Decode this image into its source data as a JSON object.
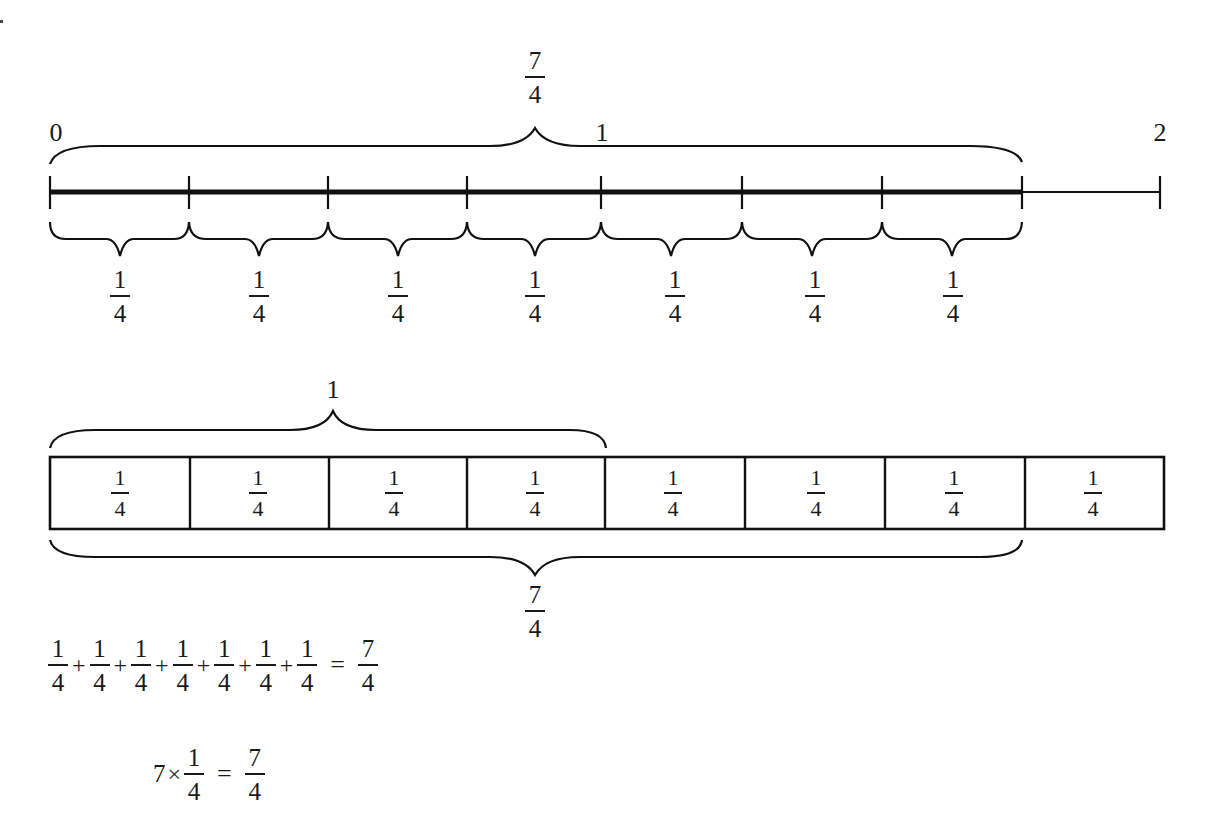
{
  "number_line": {
    "start_label": "0",
    "mid_label": "1",
    "end_label": "2",
    "total_brace_label": {
      "numerator": "7",
      "denominator": "4"
    },
    "segment_labels": [
      {
        "numerator": "1",
        "denominator": "4"
      },
      {
        "numerator": "1",
        "denominator": "4"
      },
      {
        "numerator": "1",
        "denominator": "4"
      },
      {
        "numerator": "1",
        "denominator": "4"
      },
      {
        "numerator": "1",
        "denominator": "4"
      },
      {
        "numerator": "1",
        "denominator": "4"
      },
      {
        "numerator": "1",
        "denominator": "4"
      }
    ],
    "range": [
      0,
      2
    ],
    "tick_step": "1/4",
    "highlighted_up_to": "7/4"
  },
  "tape_diagram": {
    "top_brace_label": "1",
    "bottom_brace_label": {
      "numerator": "7",
      "denominator": "4"
    },
    "cells": [
      {
        "numerator": "1",
        "denominator": "4"
      },
      {
        "numerator": "1",
        "denominator": "4"
      },
      {
        "numerator": "1",
        "denominator": "4"
      },
      {
        "numerator": "1",
        "denominator": "4"
      },
      {
        "numerator": "1",
        "denominator": "4"
      },
      {
        "numerator": "1",
        "denominator": "4"
      },
      {
        "numerator": "1",
        "denominator": "4"
      },
      {
        "numerator": "1",
        "denominator": "4"
      }
    ]
  },
  "equations": {
    "addition": {
      "terms": [
        {
          "numerator": "1",
          "denominator": "4"
        },
        {
          "numerator": "1",
          "denominator": "4"
        },
        {
          "numerator": "1",
          "denominator": "4"
        },
        {
          "numerator": "1",
          "denominator": "4"
        },
        {
          "numerator": "1",
          "denominator": "4"
        },
        {
          "numerator": "1",
          "denominator": "4"
        },
        {
          "numerator": "1",
          "denominator": "4"
        }
      ],
      "operator": "+",
      "equals": "=",
      "result": {
        "numerator": "7",
        "denominator": "4"
      }
    },
    "multiplication": {
      "factor": "7",
      "operator": "×",
      "fraction": {
        "numerator": "1",
        "denominator": "4"
      },
      "equals": "=",
      "result": {
        "numerator": "7",
        "denominator": "4"
      }
    }
  }
}
